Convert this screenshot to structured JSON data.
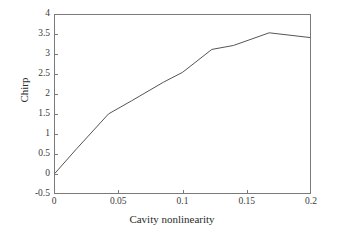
{
  "chart_data": {
    "type": "line",
    "title": "",
    "xlabel": "Cavity nonlinearity",
    "ylabel": "Chirp",
    "xlim": [
      0,
      0.2
    ],
    "ylim": [
      -0.5,
      4
    ],
    "xticks": [
      "0",
      "0.05",
      "0.1",
      "0.15",
      "0.2"
    ],
    "xtick_values": [
      0,
      0.05,
      0.1,
      0.15,
      0.2
    ],
    "yticks": [
      "-0.5",
      "0",
      "0.5",
      "1",
      "1.5",
      "2",
      "2.5",
      "3",
      "3.5",
      "4"
    ],
    "ytick_values": [
      -0.5,
      0,
      0.5,
      1,
      1.5,
      2,
      2.5,
      3,
      3.5,
      4
    ],
    "grid": false,
    "legend": null,
    "line_color": "#555555",
    "line_width": 1,
    "markers": "none",
    "series": [
      {
        "name": "Chirp",
        "x": [
          0.0,
          0.017,
          0.042,
          0.06,
          0.085,
          0.1,
          0.123,
          0.14,
          0.168,
          0.2
        ],
        "y": [
          0.0,
          0.62,
          1.5,
          1.83,
          2.3,
          2.55,
          3.13,
          3.23,
          3.55,
          3.43
        ]
      }
    ]
  }
}
